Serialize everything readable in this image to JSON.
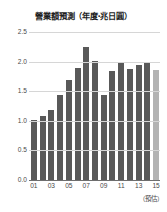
{
  "chart_data": {
    "type": "bar",
    "title": "營業額預測（年度‧兆日圓）",
    "xlabel": "",
    "ylabel": "",
    "note": "（預估）",
    "categories": [
      "01",
      "02",
      "03",
      "04",
      "05",
      "06",
      "07",
      "08",
      "09",
      "10",
      "11",
      "12",
      "13",
      "14",
      "15"
    ],
    "tick_labels": [
      "01",
      "03",
      "05",
      "07",
      "09",
      "11",
      "13",
      "15"
    ],
    "values": [
      1.02,
      1.08,
      1.19,
      1.43,
      1.69,
      1.89,
      2.24,
      2.01,
      1.44,
      1.84,
      1.98,
      1.88,
      1.95,
      1.98,
      1.86
    ],
    "forecast_flags": [
      false,
      false,
      false,
      false,
      false,
      false,
      false,
      false,
      false,
      false,
      false,
      false,
      false,
      false,
      true
    ],
    "ylim": [
      0.0,
      2.5
    ],
    "ytick_labels": [
      "2.5",
      "2.0",
      "1.5",
      "1.0",
      "0.5",
      "0.0"
    ],
    "ytick_values": [
      2.5,
      2.0,
      1.5,
      1.0,
      0.5,
      0.0
    ],
    "grid": true,
    "legend": "none",
    "colors": {
      "bar": "#595959",
      "bar_forecast": "#b3b3b3",
      "gridline": "#d6d6d6",
      "axis": "#6e6e6e",
      "text": "#4a4a4a",
      "title": "#1d1d1d",
      "background": "#ffffff"
    }
  }
}
